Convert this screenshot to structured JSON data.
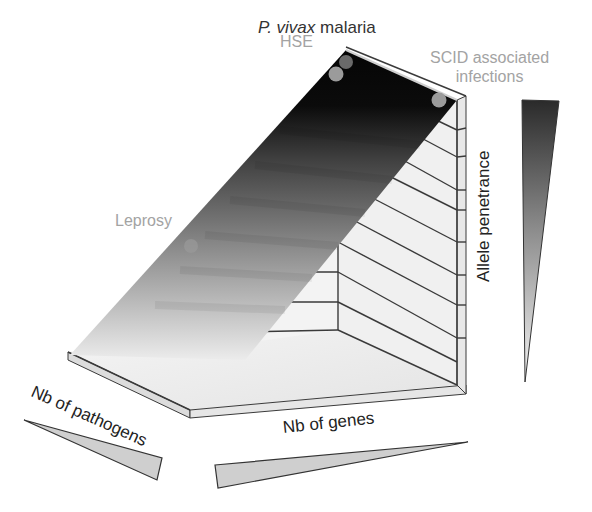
{
  "diagram": {
    "top_label_italic": "P. vivax",
    "top_label_rest": " malaria",
    "points": [
      {
        "label": "HSE",
        "x": 336,
        "y": 74
      },
      {
        "label": "P. vivax malaria",
        "x": 346,
        "y": 62
      },
      {
        "label": "SCID associated infections",
        "x": 439,
        "y": 100
      },
      {
        "label": "Leprosy",
        "x": 191,
        "y": 246
      }
    ],
    "labels": {
      "hse": "HSE",
      "scid_line1": "SCID associated",
      "scid_line2": "infections",
      "leprosy": "Leprosy",
      "allele_penetrance": "Allele penetrance",
      "nb_pathogens": "Nb of pathogens",
      "nb_genes": "Nb of genes"
    },
    "colors": {
      "slope_top": "#050505",
      "slope_bottom": "#f2f2f2",
      "point_fill": "#9b9b9b",
      "wall_fill": "#f0f0f0",
      "line": "#3a3a3a",
      "label_gray": "#a3a3a3"
    }
  }
}
